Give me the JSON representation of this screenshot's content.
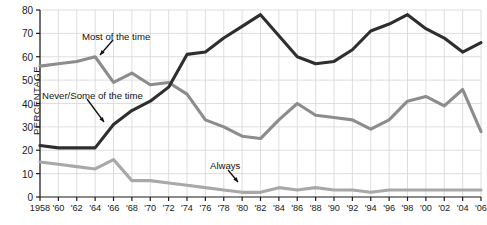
{
  "chart_data": {
    "type": "line",
    "title": "",
    "xlabel": "",
    "ylabel": "PERCENTAGE",
    "ylim": [
      0,
      80
    ],
    "ytick_values": [
      0,
      10,
      20,
      30,
      40,
      50,
      60,
      70,
      80
    ],
    "ytick_labels": [
      "0",
      "10",
      "20",
      "30",
      "40",
      "50",
      "60",
      "70",
      "80"
    ],
    "xlim": [
      1958,
      2006
    ],
    "grid": true,
    "legend_position": "inline-annotations",
    "x": [
      1958,
      1960,
      1962,
      1964,
      1966,
      1968,
      1970,
      1972,
      1974,
      1976,
      1978,
      1980,
      1982,
      1984,
      1986,
      1988,
      1990,
      1992,
      1994,
      1996,
      1998,
      2000,
      2002,
      2004,
      2006
    ],
    "xtick_labels": [
      "1958",
      "'60",
      "'62",
      "'64",
      "'66",
      "'68",
      "'70",
      "'72",
      "'74",
      "'76",
      "'78",
      "'80",
      "'82",
      "'84",
      "'86",
      "'88",
      "'90",
      "'92",
      "'94",
      "'96",
      "'98",
      "'00",
      "'02",
      "'04",
      "'06"
    ],
    "series": [
      {
        "name": "Never/Some of the time",
        "color": "#2e2e2e",
        "values": [
          22,
          21,
          21,
          21,
          31,
          37,
          41,
          47,
          61,
          62,
          68,
          73,
          78,
          69,
          60,
          57,
          58,
          63,
          71,
          74,
          78,
          72,
          68,
          62,
          66
        ]
      },
      {
        "name": "Most of the time",
        "color": "#8c8c8c",
        "values": [
          56,
          57,
          58,
          60,
          49,
          53,
          48,
          49,
          44,
          33,
          30,
          26,
          25,
          33,
          40,
          35,
          34,
          33,
          29,
          33,
          41,
          43,
          39,
          46,
          28
        ]
      },
      {
        "name": "Always",
        "color": "#a8a8a8",
        "values": [
          15,
          14,
          13,
          12,
          16,
          7,
          7,
          6,
          5,
          4,
          3,
          2,
          2,
          4,
          3,
          4,
          3,
          3,
          2,
          3,
          3,
          3,
          3,
          3,
          3
        ]
      }
    ],
    "annotations": [
      {
        "text": "Most of the time",
        "x_px": 82,
        "y_px": 31
      },
      {
        "text": "Never/Some of the time",
        "x_px": 42,
        "y_px": 90
      },
      {
        "text": "Always",
        "x_px": 210,
        "y_px": 160
      }
    ]
  }
}
